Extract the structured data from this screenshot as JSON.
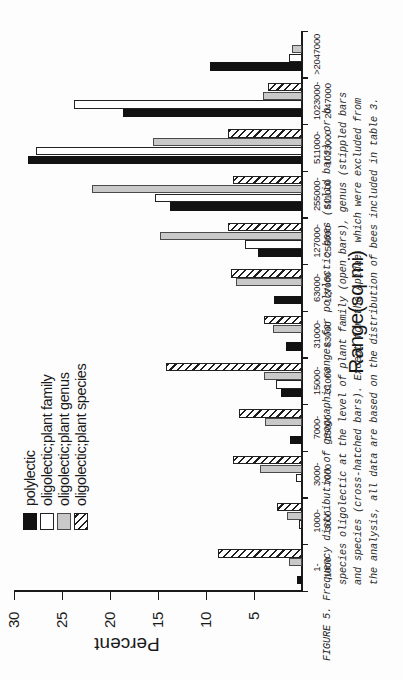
{
  "figure": {
    "label": "FIGURE 5.",
    "caption_lines": [
      "Frequency distribution of geographic ranges for polylectic bees (solid bars), or b",
      "species oligolectic at the level of plant family (open bars), genus (stippled bars",
      "and species (cross-hatched bars).  Except for the Apidae, which were excluded from",
      "the analysis, all data are based on the distribution of bees included in table 3."
    ]
  },
  "chart_data": {
    "type": "bar",
    "title": "",
    "xlabel": "Range(sq mi)",
    "ylabel": "Percent",
    "ylim": [
      0,
      30
    ],
    "yticks": [
      5,
      10,
      15,
      20,
      25,
      30
    ],
    "grid": false,
    "legend_position": "top-left",
    "categories": [
      "1-\n1000",
      "1000-\n3000",
      "3000-\n7000",
      "7000-\n15000",
      "15000-\n31000",
      "31000-\n63000",
      "63000-\n127000",
      "127000-\n255000",
      "255000-\n511000",
      "511000-\n1023000",
      "1023000-\n2047000",
      ">2047000"
    ],
    "category_labels_top": [
      "1-",
      "1000-",
      "3000-",
      "7000-",
      "15000-",
      "31000-",
      "63000-",
      "127000-",
      "255000-",
      "511000-",
      "1023000-",
      ">2047000"
    ],
    "category_labels_bottom": [
      "1000",
      "3000",
      "7000",
      "15000",
      "31000",
      "63000",
      "127000",
      "255000",
      "511000",
      "1023000",
      "2047000",
      ""
    ],
    "series": [
      {
        "name": "polylectic",
        "swatch": "solid",
        "color": "#121212",
        "values": [
          0.5,
          0.0,
          0.0,
          1.2,
          2.2,
          1.7,
          2.9,
          4.6,
          13.7,
          28.5,
          18.6,
          9.6
        ]
      },
      {
        "name": "oligolectic;plant family",
        "swatch": "open",
        "color": "#ffffff",
        "values": [
          0.0,
          0.3,
          0.6,
          0.0,
          2.7,
          0.0,
          0.0,
          5.9,
          15.3,
          27.7,
          23.7,
          1.4
        ]
      },
      {
        "name": "oligolectic;plant genus",
        "swatch": "stippled",
        "color": "#c9c9c9",
        "values": [
          1.4,
          1.6,
          4.4,
          3.9,
          4.0,
          3.0,
          6.9,
          14.8,
          21.9,
          15.5,
          4.1,
          1.0
        ]
      },
      {
        "name": "oligolectic;plant species",
        "swatch": "cross-hatched",
        "color": "#1d1d1d",
        "values": [
          8.7,
          2.6,
          7.2,
          6.6,
          14.2,
          4.0,
          7.4,
          7.7,
          7.2,
          7.7,
          3.5,
          0.0
        ]
      }
    ]
  },
  "legend": {
    "items": [
      {
        "label": "polylectic"
      },
      {
        "label": "oligolectic;plant family"
      },
      {
        "label": "oligolectic;plant genus"
      },
      {
        "label": "oligolectic;plant species"
      }
    ]
  }
}
